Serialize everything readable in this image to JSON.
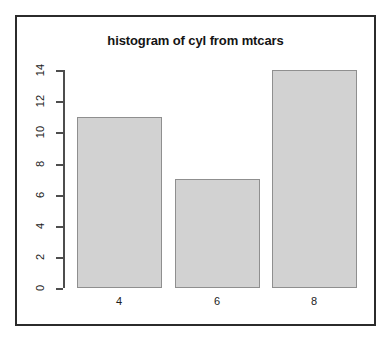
{
  "chart_data": {
    "type": "bar",
    "title": "histogram of cyl from mtcars",
    "subtitle": "",
    "xlabel": "",
    "ylabel": "",
    "categories": [
      "4",
      "6",
      "8"
    ],
    "values": [
      11,
      7,
      14
    ],
    "series": [
      {
        "name": "count",
        "values": [
          11,
          7,
          14
        ]
      }
    ],
    "ylim": [
      0,
      14
    ],
    "xlim": [
      3,
      9
    ],
    "y_ticks": [
      0,
      2,
      4,
      6,
      8,
      10,
      12,
      14
    ],
    "y_tick_labels": [
      "0",
      "2",
      "4",
      "6",
      "8",
      "10",
      "12",
      "14"
    ],
    "x_tick_labels": [
      "4",
      "6",
      "8"
    ],
    "grid": false,
    "legend": null,
    "legend_position": "none",
    "annotations": [],
    "style": {
      "bar_fill": "#d2d2d2",
      "bar_border": "#8f8f8f",
      "axis_color": "#4d4d4d",
      "text_color": "#1c1c1c",
      "frame_color": "#2b2b2b",
      "background": "#ffffff",
      "y_label_rotation": "vertical"
    }
  }
}
